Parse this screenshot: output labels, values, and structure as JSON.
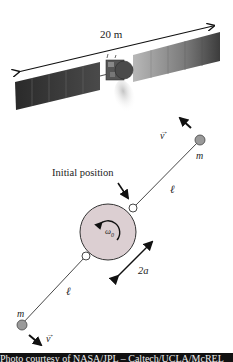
{
  "figure": {
    "spacecraft": {
      "span_label": "20 m",
      "panel_color": "#3a3a3a",
      "panel_light_color": "#8a8a8a"
    },
    "diagram": {
      "initial_position_label": "Initial position",
      "mass_label_upper": "m",
      "mass_label_lower": "m",
      "velocity_label_upper": "v",
      "velocity_label_lower": "v",
      "tether_length_label_upper": "ℓ",
      "tether_length_label_lower": "ℓ",
      "diameter_label": "2a",
      "omega_label": "ω",
      "omega_subscript": "0",
      "disk_color": "#dccfd2",
      "mass_color": "#9a9a9a"
    },
    "caption": "Photo courtesy of NASA/JPL – Caltech/UCLA/McREL"
  }
}
